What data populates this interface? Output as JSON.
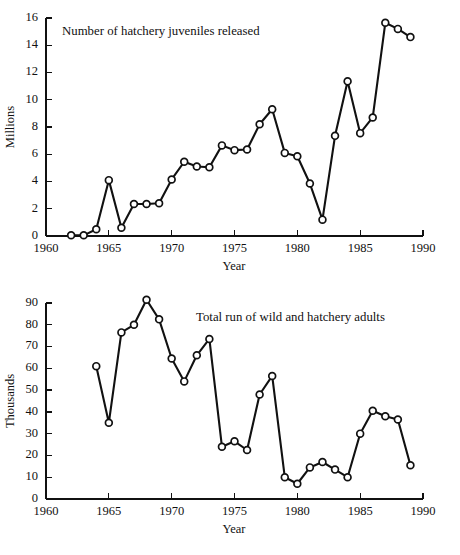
{
  "figure": {
    "background": "#ffffff",
    "ink_color": "#111111",
    "marker_fill": "#ffffff"
  },
  "chart_data": [
    {
      "id": "hatchery-juveniles",
      "type": "line",
      "title": "Number of hatchery juveniles released",
      "title_position": "inside-top-left",
      "xlabel": "Year",
      "ylabel": "Millions",
      "xlim": [
        1960,
        1990
      ],
      "ylim": [
        0,
        16
      ],
      "xticks": [
        1960,
        1965,
        1970,
        1975,
        1980,
        1985,
        1990
      ],
      "xticklabels": [
        "1960",
        "1965",
        "1970",
        "1975",
        "1980",
        "1985",
        "1990"
      ],
      "yticks": [
        0,
        2,
        4,
        6,
        8,
        10,
        12,
        14,
        16
      ],
      "yticklabels": [
        "0",
        "2",
        "4",
        "6",
        "8",
        "10",
        "12",
        "14",
        "16"
      ],
      "grid": false,
      "legend": false,
      "markers": "open-circle",
      "x": [
        1962,
        1963,
        1964,
        1965,
        1966,
        1967,
        1968,
        1969,
        1970,
        1971,
        1972,
        1973,
        1974,
        1975,
        1976,
        1977,
        1978,
        1979,
        1980,
        1981,
        1982,
        1983,
        1984,
        1985,
        1986,
        1987,
        1988,
        1989
      ],
      "values": [
        0.05,
        0.05,
        0.5,
        4.1,
        0.6,
        2.35,
        2.35,
        2.4,
        4.15,
        5.45,
        5.1,
        5.05,
        6.65,
        6.3,
        6.35,
        8.2,
        9.3,
        6.1,
        5.85,
        3.85,
        1.2,
        7.35,
        11.35,
        7.55,
        8.7,
        15.65,
        15.2,
        14.6
      ]
    },
    {
      "id": "total-run-adults",
      "type": "line",
      "title": "Total run of wild and hatchery adults",
      "title_position": "inside-top-right",
      "xlabel": "Year",
      "ylabel": "Thousands",
      "xlim": [
        1960,
        1990
      ],
      "ylim": [
        0,
        90
      ],
      "xticks": [
        1960,
        1965,
        1970,
        1975,
        1980,
        1985,
        1990
      ],
      "xticklabels": [
        "1960",
        "1965",
        "1970",
        "1975",
        "1980",
        "1985",
        "1990"
      ],
      "yticks": [
        0,
        10,
        20,
        30,
        40,
        50,
        60,
        70,
        80,
        90
      ],
      "yticklabels": [
        "0",
        "10",
        "20",
        "30",
        "40",
        "50",
        "60",
        "70",
        "80",
        "90"
      ],
      "grid": false,
      "legend": false,
      "markers": "open-circle",
      "x": [
        1964,
        1965,
        1966,
        1967,
        1968,
        1969,
        1970,
        1971,
        1972,
        1973,
        1974,
        1975,
        1976,
        1977,
        1978,
        1979,
        1980,
        1981,
        1982,
        1983,
        1984,
        1985,
        1986,
        1987,
        1988,
        1989
      ],
      "values": [
        61,
        35,
        76.5,
        80,
        91.5,
        82.5,
        64.5,
        54,
        66,
        73.5,
        24,
        26.5,
        22.5,
        48,
        56.5,
        10,
        7,
        14.5,
        17,
        13.5,
        10,
        30,
        40.5,
        38,
        36.5,
        15.5
      ]
    }
  ]
}
